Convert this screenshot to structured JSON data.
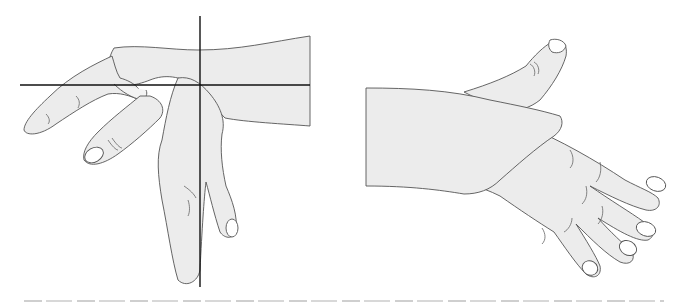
{
  "figure": {
    "left_panel": {
      "description": "Hand in wrist flexion with horizontal and vertical reference axes",
      "axes": {
        "horizontal": true,
        "vertical": true,
        "color": "#111111"
      }
    },
    "right_panel": {
      "description": "Hand viewed from dorsal side, forearm and thumb extended"
    },
    "caption": {
      "text": "",
      "truncated": true
    },
    "colors": {
      "background": "#ffffff",
      "skin_fill": "#ececec",
      "outline": "#555555"
    }
  }
}
